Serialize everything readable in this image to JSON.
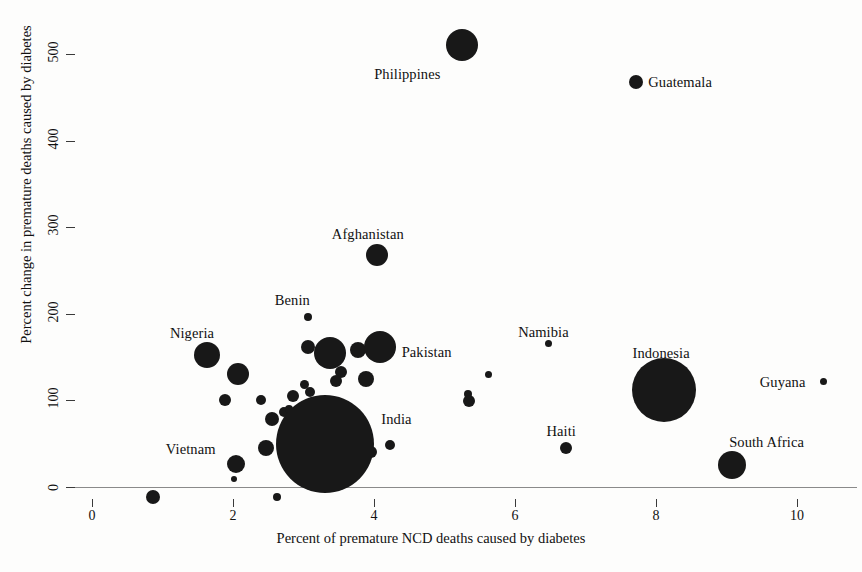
{
  "chart_data": {
    "type": "scatter",
    "title": "",
    "xlabel": "Percent of premature NCD deaths caused by diabetes",
    "ylabel": "Percent change in premature deaths caused by diabetes",
    "xlim": [
      -0.35,
      10.8
    ],
    "ylim": [
      -30,
      545
    ],
    "xticks": [
      0,
      2,
      4,
      6,
      8,
      10
    ],
    "xtick_labels": [
      "0",
      "2",
      "4",
      "6",
      "8",
      "10"
    ],
    "yticks": [
      0,
      100,
      200,
      300,
      400,
      500
    ],
    "ytick_labels": [
      "0",
      "100",
      "200",
      "300",
      "400",
      "500"
    ],
    "grid": false,
    "legend": "none",
    "marker_color": "#181818",
    "axis_color": "#8a8a8a",
    "size_encoding": "bubble area proportional to number of premature deaths caused by diabetes",
    "labeled_points": [
      {
        "name": "Philippines",
        "x": 5.25,
        "y": 510,
        "size": 16,
        "label_dx": -88,
        "label_dy": 22
      },
      {
        "name": "Guatemala",
        "x": 7.72,
        "y": 468,
        "size": 7,
        "label_dx": 12,
        "label_dy": -7
      },
      {
        "name": "Afghanistan",
        "x": 4.04,
        "y": 268,
        "size": 11,
        "label_dx": -45,
        "label_dy": -28
      },
      {
        "name": "Benin",
        "x": 3.06,
        "y": 196,
        "size": 4,
        "label_dx": -33,
        "label_dy": -24
      },
      {
        "name": "Pakistan",
        "x": 4.08,
        "y": 162,
        "size": 16,
        "label_dx": 22,
        "label_dy": -2
      },
      {
        "name": "Nigeria",
        "x": 1.63,
        "y": 152,
        "size": 13,
        "label_dx": -37,
        "label_dy": -29
      },
      {
        "name": "Namibia",
        "x": 6.47,
        "y": 166,
        "size": 3.5,
        "label_dx": -30,
        "label_dy": -18
      },
      {
        "name": "Indonesia",
        "x": 8.12,
        "y": 112,
        "size": 32,
        "label_dx": -32,
        "label_dy": -44
      },
      {
        "name": "Guyana",
        "x": 10.38,
        "y": 122,
        "size": 3.5,
        "label_dx": -64,
        "label_dy": -6
      },
      {
        "name": "India",
        "x": 3.31,
        "y": 50,
        "size": 49,
        "label_dx": 56,
        "label_dy": -32
      },
      {
        "name": "Haiti",
        "x": 6.73,
        "y": 45,
        "size": 6,
        "label_dx": -20,
        "label_dy": -24
      },
      {
        "name": "South Africa",
        "x": 9.08,
        "y": 25,
        "size": 14,
        "label_dx": -3,
        "label_dy": -30
      },
      {
        "name": "Vietnam",
        "x": 2.04,
        "y": 27,
        "size": 9,
        "label_dx": -70,
        "label_dy": -22
      }
    ],
    "unlabeled_points": [
      {
        "x": 3.07,
        "y": 162,
        "size": 7
      },
      {
        "x": 3.38,
        "y": 155,
        "size": 16
      },
      {
        "x": 3.78,
        "y": 158,
        "size": 8
      },
      {
        "x": 2.07,
        "y": 131,
        "size": 11
      },
      {
        "x": 3.88,
        "y": 125,
        "size": 8
      },
      {
        "x": 3.53,
        "y": 133,
        "size": 6
      },
      {
        "x": 3.46,
        "y": 122,
        "size": 6
      },
      {
        "x": 3.01,
        "y": 118,
        "size": 4.5
      },
      {
        "x": 5.62,
        "y": 130,
        "size": 3.5
      },
      {
        "x": 5.34,
        "y": 107,
        "size": 4
      },
      {
        "x": 5.35,
        "y": 99,
        "size": 6
      },
      {
        "x": 1.88,
        "y": 100,
        "size": 6
      },
      {
        "x": 2.4,
        "y": 100,
        "size": 5
      },
      {
        "x": 2.85,
        "y": 105,
        "size": 6
      },
      {
        "x": 3.09,
        "y": 110,
        "size": 5
      },
      {
        "x": 2.72,
        "y": 87,
        "size": 5
      },
      {
        "x": 2.79,
        "y": 90,
        "size": 4
      },
      {
        "x": 2.56,
        "y": 78,
        "size": 7
      },
      {
        "x": 2.47,
        "y": 45,
        "size": 8
      },
      {
        "x": 4.22,
        "y": 48,
        "size": 5
      },
      {
        "x": 3.96,
        "y": 40,
        "size": 6
      },
      {
        "x": 3.92,
        "y": 52,
        "size": 3
      },
      {
        "x": 2.02,
        "y": 9,
        "size": 3
      },
      {
        "x": 0.87,
        "y": -12,
        "size": 7
      },
      {
        "x": 2.62,
        "y": -12,
        "size": 4
      }
    ]
  }
}
